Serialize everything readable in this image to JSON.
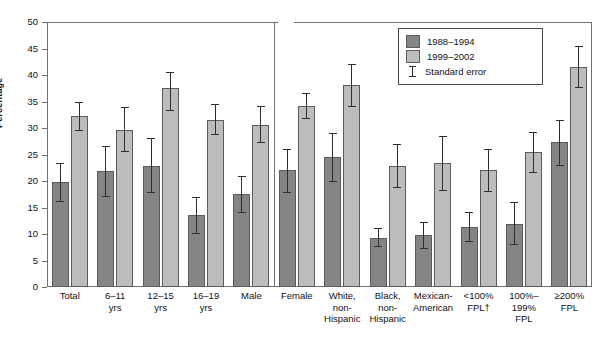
{
  "chart_data": {
    "type": "bar",
    "title": "",
    "xlabel": "",
    "ylabel": "Percentage",
    "ylim": [
      0,
      50
    ],
    "ytick_step": 5,
    "yticks": [
      50,
      45,
      40,
      35,
      30,
      25,
      20,
      15,
      10,
      5,
      0
    ],
    "grid": false,
    "legend_position": "top-right",
    "categories": [
      "Total",
      "6–11\nyrs",
      "12–15\nyrs",
      "16–19\nyrs",
      "Male",
      "Female",
      "White,\nnon-\nHispanic",
      "Black,\nnon-\nHispanic",
      "Mexican-\nAmerican",
      "<100%\nFPL†",
      "100%–199%\nFPL",
      "≥200%\nFPL"
    ],
    "series": [
      {
        "name": "1988–1994",
        "color": "#858585",
        "values": [
          19.8,
          21.8,
          22.9,
          13.5,
          17.5,
          22.1,
          24.6,
          9.3,
          9.8,
          11.4,
          11.9,
          27.3
        ],
        "err_low": [
          16.1,
          17.0,
          17.8,
          10.0,
          14.0,
          17.8,
          19.8,
          7.5,
          7.2,
          8.5,
          8.0,
          22.8
        ],
        "err_high": [
          23.4,
          26.6,
          28.2,
          17.0,
          21.0,
          26.1,
          29.0,
          11.2,
          12.2,
          14.2,
          16.0,
          31.6
        ]
      },
      {
        "name": "1999–2002",
        "color": "#bcbcbc",
        "values": [
          32.2,
          29.7,
          37.6,
          31.6,
          30.6,
          34.2,
          38.1,
          22.8,
          23.4,
          22.1,
          25.4,
          41.6
        ],
        "err_low": [
          29.5,
          25.4,
          33.2,
          28.7,
          27.1,
          31.7,
          33.9,
          18.7,
          18.2,
          17.9,
          21.5,
          37.6
        ],
        "err_high": [
          35.0,
          33.9,
          40.5,
          34.5,
          34.2,
          36.6,
          42.1,
          26.9,
          28.5,
          26.0,
          29.3,
          45.4
        ]
      }
    ],
    "separator_after_category": "Male"
  },
  "legend": {
    "items": [
      {
        "label": "1988–1994",
        "icon": "swatch-dark"
      },
      {
        "label": "1999–2002",
        "icon": "swatch-light"
      },
      {
        "label": "Standard error",
        "icon": "error-bar-icon"
      }
    ]
  },
  "axis": {
    "y_title": "Percentage"
  }
}
